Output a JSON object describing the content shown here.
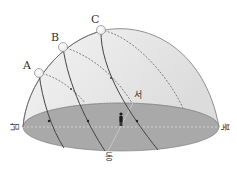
{
  "diagram": {
    "type": "celestial-sphere-sun-paths",
    "suns": [
      {
        "label": "A",
        "x": 39,
        "y": 73
      },
      {
        "label": "B",
        "x": 63,
        "y": 47
      },
      {
        "label": "C",
        "x": 101,
        "y": 30
      }
    ],
    "directions": {
      "south": "남",
      "north": "북",
      "east": "동",
      "west": "서"
    },
    "colors": {
      "horizon_fill": "#a8a8a8",
      "dome_fill": "#e9e9e9",
      "line": "#555555",
      "sun_fill": "#ffffff",
      "figure": "#222222"
    }
  }
}
